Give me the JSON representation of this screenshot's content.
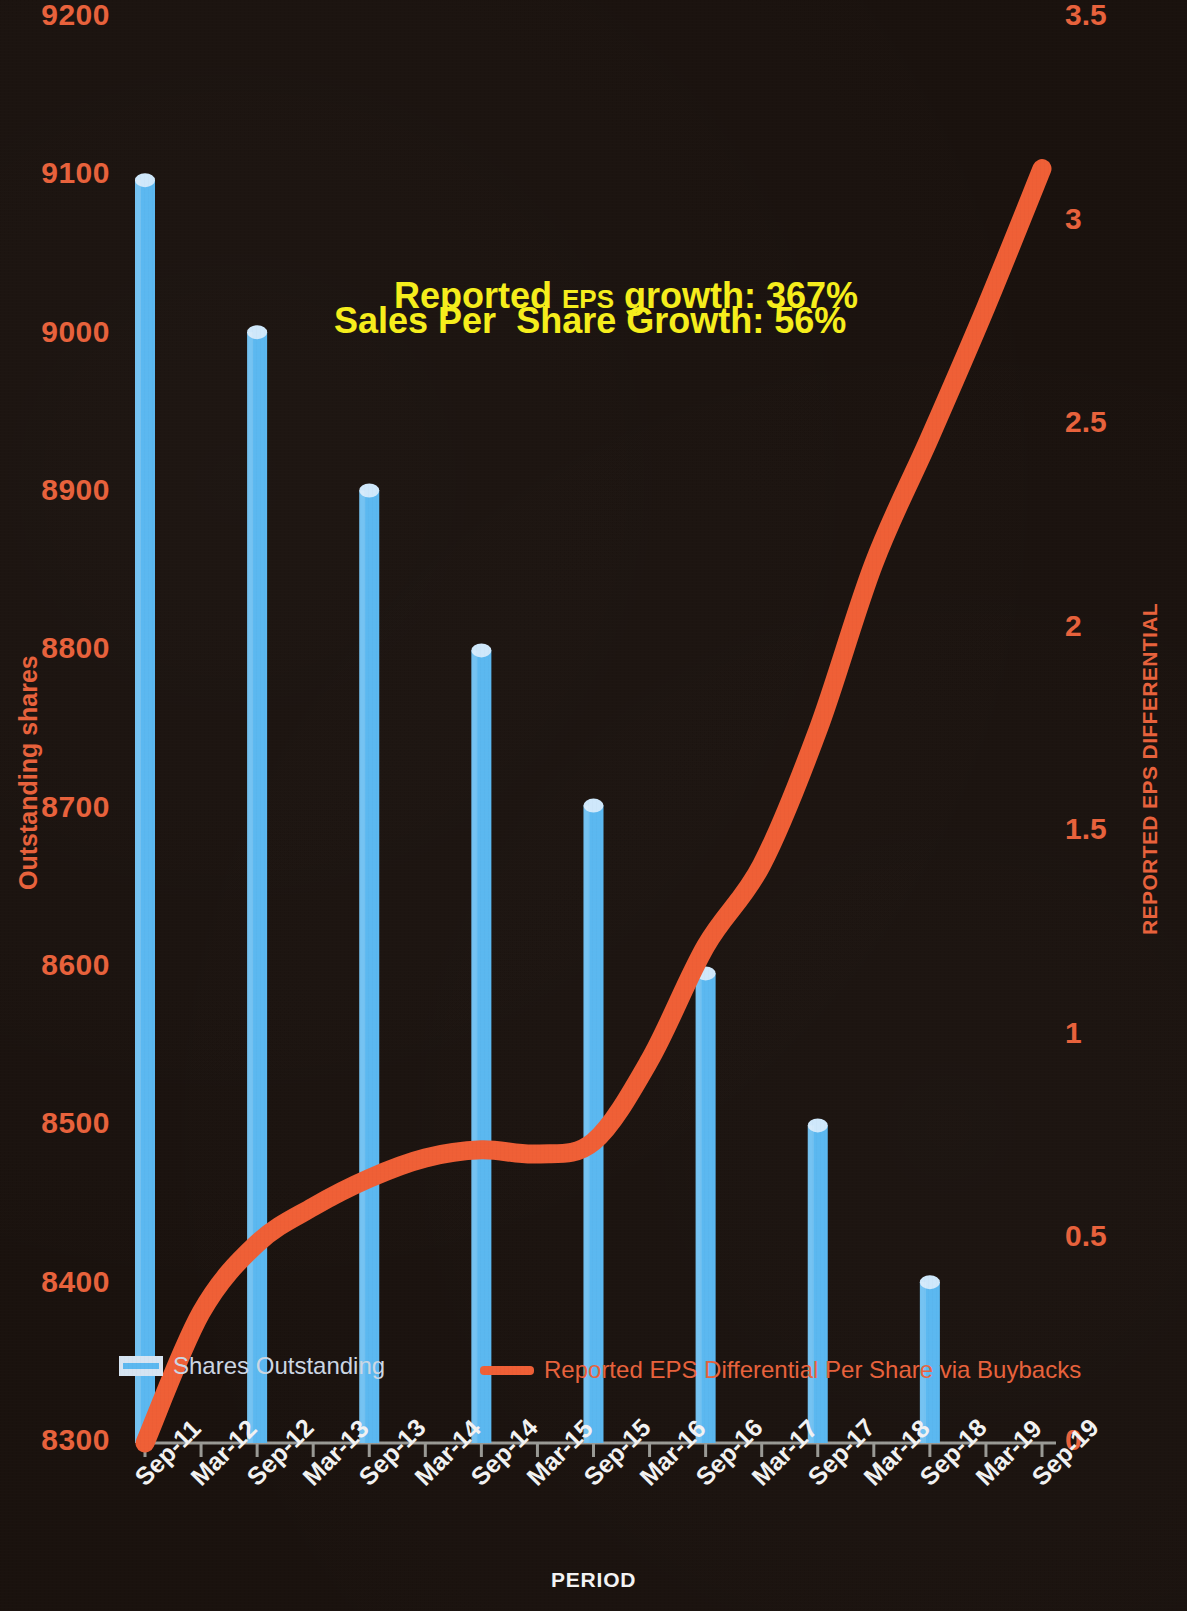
{
  "chart_data": {
    "type": "bar",
    "title": "",
    "xlabel": "PERIOD",
    "ylabel": "Outstanding shares",
    "y2label": "REPORTED EPS DIFFERENTIAL",
    "grid": false,
    "legend_position": "inside-bottom",
    "categories": [
      "Sep-11",
      "Mar-12",
      "Sep-12",
      "Mar-13",
      "Sep-13",
      "Mar-14",
      "Sep-14",
      "Mar-15",
      "Sep-15",
      "Mar-16",
      "Sep-16",
      "Mar-17",
      "Sep-17",
      "Mar-18",
      "Sep-18",
      "Mar-19",
      "Sep-19"
    ],
    "ylim": [
      8300,
      9200
    ],
    "yticks": [
      "8300",
      "8400",
      "8500",
      "8600",
      "8700",
      "8800",
      "8900",
      "9000",
      "9100",
      "9200"
    ],
    "y2lim": [
      0,
      3.5
    ],
    "y2ticks": [
      "0",
      "0.5",
      "1",
      "1.5",
      "2",
      "2.5",
      "3",
      "3.5"
    ],
    "series": [
      {
        "name": "Shares Outstanding",
        "type": "bar",
        "color": "#5bb8f0",
        "axis": "left",
        "x": [
          "Sep-11",
          "Sep-12",
          "Sep-13",
          "Sep-14",
          "Sep-15",
          "Sep-16",
          "Sep-17",
          "Sep-18"
        ],
        "values": [
          9102,
          9006,
          8906,
          8805,
          8707,
          8601,
          8505,
          8406
        ]
      },
      {
        "name": "Reported EPS Differential Per Share via Buybacks",
        "type": "line",
        "color": "#ef5f36",
        "axis": "right",
        "x": [
          "Sep-11",
          "Mar-12",
          "Sep-12",
          "Mar-13",
          "Sep-13",
          "Mar-14",
          "Sep-14",
          "Mar-15",
          "Sep-15",
          "Mar-16",
          "Sep-16",
          "Mar-17",
          "Sep-17",
          "Mar-18",
          "Sep-18",
          "Mar-19",
          "Sep-19"
        ],
        "values": [
          0.0,
          0.32,
          0.49,
          0.58,
          0.65,
          0.7,
          0.72,
          0.71,
          0.74,
          0.94,
          1.22,
          1.42,
          1.75,
          2.16,
          2.47,
          2.79,
          3.13
        ]
      }
    ]
  },
  "annotations": {
    "line1": "Reported EPS growth: 367%",
    "line1_lead": "Reported ",
    "line1_small": "EPS",
    "line1_tail": " growth: 367%",
    "line2": "Sales Per  Share Growth: 56%"
  },
  "legend": {
    "bar_label": "Shares Outstanding",
    "line_label": "Reported EPS Differential Per Share via Buybacks"
  },
  "axes": {
    "left_title": "Outstanding shares",
    "right_title": "REPORTED EPS DIFFERENTIAL",
    "bottom_title": "PERIOD"
  },
  "colors": {
    "bar": "#5bb8f0",
    "line": "#ef5f36",
    "axis_text": "#e8623c",
    "tick_text": "#f2f2f2",
    "annotation": "#f6ee1c",
    "background": "#1a120e"
  }
}
